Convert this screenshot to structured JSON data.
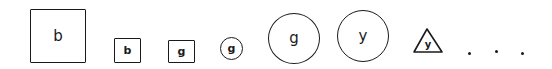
{
  "diagram": {
    "items": [
      {
        "shape": "square",
        "size": "large",
        "label": "b"
      },
      {
        "shape": "square",
        "size": "small",
        "label": "b"
      },
      {
        "shape": "square",
        "size": "small",
        "label": "g"
      },
      {
        "shape": "circle",
        "size": "small",
        "label": "g"
      },
      {
        "shape": "circle",
        "size": "large",
        "label": "g"
      },
      {
        "shape": "circle",
        "size": "large",
        "label": "y"
      },
      {
        "shape": "triangle",
        "size": "small",
        "label": "y"
      }
    ],
    "continuation": "..."
  }
}
